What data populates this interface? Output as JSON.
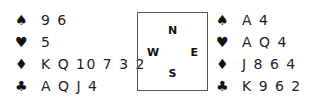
{
  "hands": {
    "west": [
      {
        "suit": "spades",
        "symbol": "♠",
        "cards": "9 6"
      },
      {
        "suit": "hearts",
        "symbol": "♥",
        "cards": "5"
      },
      {
        "suit": "diamonds",
        "symbol": "♦",
        "cards": "K Q 10 7 3 2"
      },
      {
        "suit": "clubs",
        "symbol": "♣",
        "cards": "A Q J 4"
      }
    ],
    "east": [
      {
        "suit": "spades",
        "symbol": "♠",
        "cards": "A 4"
      },
      {
        "suit": "hearts",
        "symbol": "♥",
        "cards": "A Q 4"
      },
      {
        "suit": "diamonds",
        "symbol": "♦",
        "cards": "J 8 6 4"
      },
      {
        "suit": "clubs",
        "symbol": "♣",
        "cards": "K 9 6 2"
      }
    ]
  },
  "compass": {
    "north": "N",
    "south": "S",
    "west": "W",
    "east": "E"
  }
}
